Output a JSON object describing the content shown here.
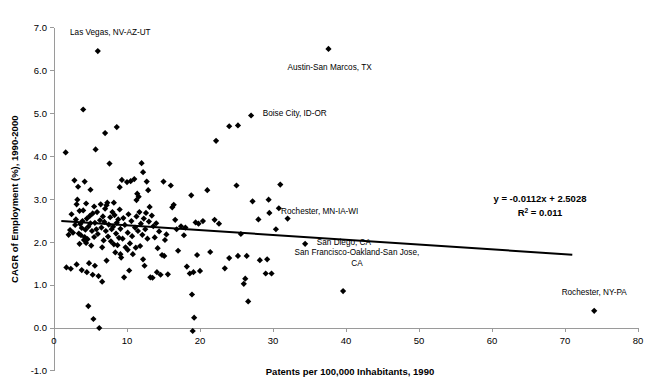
{
  "chart_data": {
    "type": "scatter",
    "title": "",
    "xlabel": "Patents per 100,000 Inhabitants, 1990",
    "ylabel": "CAGR of Employment (%), 1990-2000",
    "xlim": [
      0,
      80
    ],
    "ylim": [
      -1.0,
      7.0
    ],
    "xticks": [
      "0",
      "10",
      "20",
      "30",
      "40",
      "50",
      "60",
      "70",
      "80"
    ],
    "xtick_values": [
      0,
      10,
      20,
      30,
      40,
      50,
      60,
      70,
      80
    ],
    "yticks": [
      "-1.0",
      "0.0",
      "1.0",
      "2.0",
      "3.0",
      "4.0",
      "5.0",
      "6.0",
      "7.0"
    ],
    "ytick_values": [
      -1.0,
      0.0,
      1.0,
      2.0,
      3.0,
      4.0,
      5.0,
      6.0,
      7.0
    ],
    "grid": false,
    "legend": "none",
    "marker_color": "#000000",
    "trendline_color": "#000000",
    "trendline": {
      "equation": "y = -0.0112x + 2.5028",
      "r_squared_label": "R",
      "r_squared_sup": "2",
      "r_squared_value": "= 0.011",
      "slope": -0.0112,
      "intercept": 2.5028,
      "x_start": 1.0,
      "x_end": 71.0
    },
    "annotations": [
      {
        "text": "Las Vegas, NV-AZ-UT",
        "x": 6.0,
        "y": 6.45,
        "label_x": 2.2,
        "label_y": 6.82,
        "anchor": "start"
      },
      {
        "text": "Austin-San Marcos, TX",
        "x": 37.6,
        "y": 6.5,
        "label_x": 32.0,
        "label_y": 6.02,
        "anchor": "start"
      },
      {
        "text": "Boise City, ID-OR",
        "x": 27.0,
        "y": 4.95,
        "label_x": 28.6,
        "label_y": 4.93,
        "anchor": "start"
      },
      {
        "text": "Rochester, MN-IA-WI",
        "x": 29.5,
        "y": 2.68,
        "label_x": 31.1,
        "label_y": 2.66,
        "anchor": "start"
      },
      {
        "text": "San Diego, CA",
        "x": 34.4,
        "y": 1.96,
        "label_x": 36.0,
        "label_y": 1.94,
        "anchor": "start"
      },
      {
        "text": "San Francisco-Oakland-San Jose,",
        "x": null,
        "y": null,
        "label_x": 41.5,
        "label_y": 1.71,
        "anchor": "middle"
      },
      {
        "text": "CA",
        "x": null,
        "y": null,
        "label_x": 41.5,
        "label_y": 1.45,
        "anchor": "middle"
      },
      {
        "text": "Rochester, NY-PA",
        "x": 74.0,
        "y": 0.4,
        "label_x": 74.0,
        "label_y": 0.78,
        "anchor": "middle"
      }
    ],
    "points": [
      [
        1.6,
        4.09
      ],
      [
        1.7,
        1.41
      ],
      [
        2.0,
        2.17
      ],
      [
        2.2,
        2.28
      ],
      [
        2.4,
        2.65
      ],
      [
        2.6,
        2.22
      ],
      [
        2.8,
        3.44
      ],
      [
        2.9,
        2.4
      ],
      [
        3.0,
        2.53
      ],
      [
        3.1,
        1.48
      ],
      [
        3.2,
        2.99
      ],
      [
        3.3,
        3.29
      ],
      [
        3.4,
        2.2
      ],
      [
        3.5,
        2.73
      ],
      [
        3.5,
        1.96
      ],
      [
        3.6,
        2.42
      ],
      [
        3.7,
        2.16
      ],
      [
        3.8,
        1.35
      ],
      [
        3.8,
        2.33
      ],
      [
        3.9,
        2.49
      ],
      [
        4.0,
        5.09
      ],
      [
        4.0,
        2.74
      ],
      [
        4.1,
        2.05
      ],
      [
        4.2,
        3.41
      ],
      [
        4.2,
        2.12
      ],
      [
        4.3,
        2.29
      ],
      [
        4.4,
        1.98
      ],
      [
        4.5,
        2.55
      ],
      [
        4.5,
        1.3
      ],
      [
        4.6,
        2.07
      ],
      [
        4.7,
        2.36
      ],
      [
        4.7,
        0.51
      ],
      [
        4.8,
        1.51
      ],
      [
        4.9,
        2.61
      ],
      [
        5.0,
        3.22
      ],
      [
        5.0,
        2.44
      ],
      [
        5.1,
        1.92
      ],
      [
        5.2,
        2.26
      ],
      [
        5.3,
        2.67
      ],
      [
        5.3,
        1.24
      ],
      [
        5.4,
        0.21
      ],
      [
        5.5,
        2.83
      ],
      [
        5.5,
        2.12
      ],
      [
        5.6,
        2.45
      ],
      [
        5.7,
        4.16
      ],
      [
        5.8,
        2.3
      ],
      [
        5.9,
        2.7
      ],
      [
        6.0,
        6.45
      ],
      [
        6.0,
        2.19
      ],
      [
        6.1,
        1.21
      ],
      [
        6.2,
        0.0
      ],
      [
        6.3,
        2.51
      ],
      [
        6.4,
        2.88
      ],
      [
        6.5,
        2.34
      ],
      [
        6.6,
        1.08
      ],
      [
        6.7,
        2.6
      ],
      [
        6.8,
        2.04
      ],
      [
        6.9,
        2.47
      ],
      [
        7.0,
        4.54
      ],
      [
        7.0,
        2.78
      ],
      [
        7.1,
        2.26
      ],
      [
        7.2,
        1.57
      ],
      [
        7.3,
        2.92
      ],
      [
        7.4,
        2.13
      ],
      [
        7.5,
        2.41
      ],
      [
        7.6,
        3.83
      ],
      [
        7.7,
        2.58
      ],
      [
        7.8,
        2.02
      ],
      [
        7.9,
        2.3
      ],
      [
        8.0,
        2.7
      ],
      [
        8.1,
        2.36
      ],
      [
        8.2,
        1.95
      ],
      [
        8.3,
        2.63
      ],
      [
        8.4,
        1.76
      ],
      [
        8.5,
        2.2
      ],
      [
        8.6,
        4.68
      ],
      [
        8.6,
        2.45
      ],
      [
        8.7,
        1.93
      ],
      [
        8.8,
        2.53
      ],
      [
        8.9,
        2.1
      ],
      [
        9.0,
        3.28
      ],
      [
        9.0,
        2.76
      ],
      [
        9.1,
        2.31
      ],
      [
        9.2,
        1.64
      ],
      [
        9.3,
        3.45
      ],
      [
        9.4,
        2.08
      ],
      [
        9.5,
        2.56
      ],
      [
        9.6,
        1.18
      ],
      [
        9.7,
        2.4
      ],
      [
        9.8,
        1.88
      ],
      [
        10.0,
        3.4
      ],
      [
        10.1,
        2.22
      ],
      [
        10.2,
        2.65
      ],
      [
        10.3,
        1.34
      ],
      [
        10.4,
        1.97
      ],
      [
        10.5,
        3.42
      ],
      [
        10.6,
        2.49
      ],
      [
        10.7,
        2.14
      ],
      [
        10.8,
        1.72
      ],
      [
        11.0,
        3.47
      ],
      [
        11.1,
        2.34
      ],
      [
        11.2,
        1.87
      ],
      [
        11.3,
        2.6
      ],
      [
        11.4,
        3.13
      ],
      [
        11.5,
        2.26
      ],
      [
        11.6,
        3.06
      ],
      [
        11.7,
        2.7
      ],
      [
        11.8,
        1.91
      ],
      [
        11.9,
        2.43
      ],
      [
        12.0,
        3.84
      ],
      [
        12.1,
        2.17
      ],
      [
        12.2,
        3.63
      ],
      [
        12.3,
        2.55
      ],
      [
        12.4,
        1.45
      ],
      [
        12.5,
        2.3
      ],
      [
        12.6,
        2.68
      ],
      [
        12.7,
        3.41
      ],
      [
        12.8,
        2.08
      ],
      [
        12.9,
        3.21
      ],
      [
        13.0,
        2.48
      ],
      [
        13.2,
        1.18
      ],
      [
        13.4,
        2.62
      ],
      [
        13.5,
        1.17
      ],
      [
        13.6,
        2.37
      ],
      [
        13.8,
        2.11
      ],
      [
        14.0,
        2.44
      ],
      [
        14.2,
        1.86
      ],
      [
        14.4,
        2.25
      ],
      [
        14.6,
        1.24
      ],
      [
        14.8,
        1.7
      ],
      [
        15.0,
        3.41
      ],
      [
        15.2,
        2.05
      ],
      [
        15.4,
        2.18
      ],
      [
        15.6,
        1.25
      ],
      [
        16.0,
        3.32
      ],
      [
        16.2,
        2.81
      ],
      [
        16.4,
        2.87
      ],
      [
        16.6,
        2.52
      ],
      [
        17.0,
        1.8
      ],
      [
        17.4,
        2.37
      ],
      [
        17.8,
        2.16
      ],
      [
        18.2,
        1.43
      ],
      [
        18.6,
        1.27
      ],
      [
        18.8,
        3.09
      ],
      [
        18.9,
        0.78
      ],
      [
        19.0,
        -0.07
      ],
      [
        19.2,
        0.24
      ],
      [
        19.4,
        2.46
      ],
      [
        19.8,
        2.43
      ],
      [
        20.4,
        2.49
      ],
      [
        21.0,
        3.21
      ],
      [
        21.4,
        1.77
      ],
      [
        22.0,
        2.52
      ],
      [
        23.4,
        1.39
      ],
      [
        24.0,
        1.63
      ],
      [
        25.0,
        3.32
      ],
      [
        25.2,
        1.68
      ],
      [
        25.6,
        2.19
      ],
      [
        26.0,
        1.03
      ],
      [
        26.2,
        1.15
      ],
      [
        26.4,
        1.68
      ],
      [
        26.6,
        0.62
      ],
      [
        27.0,
        4.95
      ],
      [
        27.2,
        2.95
      ],
      [
        28.0,
        2.53
      ],
      [
        28.2,
        1.58
      ],
      [
        29.0,
        1.27
      ],
      [
        29.2,
        1.6
      ],
      [
        29.4,
        2.99
      ],
      [
        29.5,
        2.68
      ],
      [
        29.8,
        1.27
      ],
      [
        30.4,
        2.3
      ],
      [
        30.8,
        2.79
      ],
      [
        31.0,
        3.34
      ],
      [
        32.0,
        2.55
      ],
      [
        34.4,
        1.96
      ],
      [
        24.0,
        4.7
      ],
      [
        25.2,
        4.72
      ],
      [
        22.2,
        4.36
      ],
      [
        22.6,
        2.43
      ],
      [
        19.6,
        1.7
      ],
      [
        20.0,
        1.33
      ],
      [
        37.6,
        6.5
      ],
      [
        39.6,
        0.86
      ],
      [
        74.0,
        0.4
      ],
      [
        2.3,
        1.38
      ],
      [
        3.1,
        2.88
      ],
      [
        4.4,
        2.9
      ],
      [
        5.6,
        1.45
      ],
      [
        6.6,
        1.88
      ],
      [
        7.2,
        2.86
      ],
      [
        8.2,
        2.92
      ],
      [
        9.1,
        1.72
      ],
      [
        10.1,
        1.82
      ],
      [
        11.3,
        2.98
      ],
      [
        12.2,
        1.6
      ],
      [
        13.1,
        2.82
      ],
      [
        14.1,
        1.3
      ],
      [
        15.1,
        1.68
      ],
      [
        16.8,
        2.3
      ],
      [
        18.0,
        2.34
      ],
      [
        19.1,
        1.3
      ]
    ]
  }
}
